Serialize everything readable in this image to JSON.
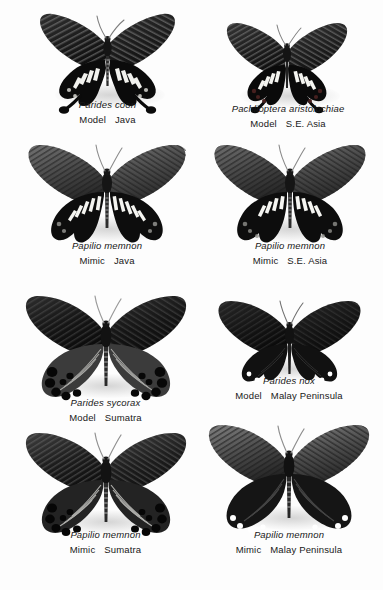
{
  "plate": {
    "title": "Batesian mimicry plate: swallowtail models and Papilio memnon mimics",
    "background_color": "#fdfdfd",
    "text_color": "#181818",
    "columns": 2,
    "rows": 4
  },
  "specimens": [
    {
      "id": "parides-coon",
      "sci_name": "Parides coon",
      "role": "Model",
      "locality": "Java",
      "row": 1,
      "column": "left",
      "wing_color": "#1b1b1b",
      "pattern": "dark forewings with pale striations; black hindwings with white bar-spots and long clubbed tails"
    },
    {
      "id": "pachlioptera-aristolochiae",
      "sci_name": "Pachlioptera aristolochiae",
      "role": "Model",
      "locality": "S.E. Asia",
      "row": 1,
      "column": "right",
      "wing_color": "#1b1b1b",
      "pattern": "dark forewings with pale rays; black hindwings with white discal patch and red marginal lunules"
    },
    {
      "id": "papilio-memnon-java",
      "sci_name": "Papilio memnon",
      "role": "Mimic",
      "locality": "Java",
      "row": 2,
      "column": "left",
      "wing_color": "#2a2a2a",
      "pattern": "grey-rayed forewings; black hindwings with white streaks mimicking Parides coon"
    },
    {
      "id": "papilio-memnon-se-asia",
      "sci_name": "Papilio memnon",
      "role": "Mimic",
      "locality": "S.E. Asia",
      "row": 2,
      "column": "right",
      "wing_color": "#2a2a2a",
      "pattern": "grey-rayed forewings; black hindwings with white discal patch mimicking Pachlioptera aristolochiae"
    },
    {
      "id": "parides-sycorax",
      "sci_name": "Parides sycorax",
      "role": "Model",
      "locality": "Sumatra",
      "row": 3,
      "column": "left",
      "wing_color": "#141414",
      "pattern": "very dark forewings; broad hindwings with grey rays and bold black submarginal ocelli"
    },
    {
      "id": "parides-nox",
      "sci_name": "Parides nox",
      "role": "Model",
      "locality": "Malay Peninsula",
      "row": 3,
      "column": "right",
      "wing_color": "#131313",
      "pattern": "uniformly blackish-brown wings, scalloped hindwing margin, no tails"
    },
    {
      "id": "papilio-memnon-sumatra",
      "sci_name": "Papilio memnon",
      "role": "Mimic",
      "locality": "Sumatra",
      "row": 4,
      "column": "left",
      "wing_color": "#1f1f1f",
      "pattern": "dark forewings; hindwings with pale rays and black submarginal spots mimicking Parides sycorax"
    },
    {
      "id": "papilio-memnon-malay",
      "sci_name": "Papilio memnon",
      "role": "Mimic",
      "locality": "Malay Peninsula",
      "row": 4,
      "column": "right",
      "wing_color": "#1d1d1d",
      "pattern": "pale-rayed forewings; dark scalloped hindwings mimicking Parides nox"
    }
  ]
}
